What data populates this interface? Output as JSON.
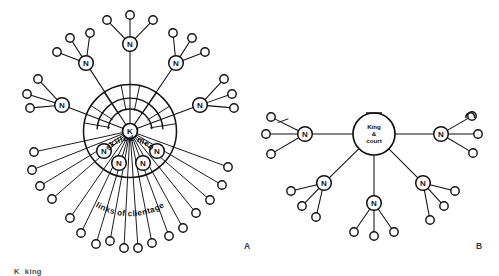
{
  "figure": {
    "background_color": "#ffffff",
    "ink_color": "#111111",
    "panels": [
      {
        "id": "A",
        "label": "A",
        "label_x": 247,
        "label_y": 249
      },
      {
        "id": "B",
        "label": "B",
        "label_x": 479,
        "label_y": 249
      }
    ],
    "legend": {
      "key": "K",
      "term": "king"
    }
  },
  "chart_data": {
    "type": "diagram",
    "panel_a": {
      "label": "A",
      "description": "Radial king-centred network with inner band of skilled men and outer links of clientage",
      "center": {
        "x": 130,
        "y": 131,
        "r": 7.5,
        "label": "K"
      },
      "boundaries": [
        {
          "name": "outer-circle",
          "cx": 130,
          "cy": 131,
          "r": 46.5
        },
        {
          "name": "inner-arc-outer",
          "cx": 130,
          "cy": 131,
          "r": 33.0,
          "start_deg": 183,
          "end_deg": 357
        },
        {
          "name": "inner-arc-inner",
          "cx": 130,
          "cy": 131,
          "r": 22.0,
          "start_deg": 185,
          "end_deg": 355
        }
      ],
      "arc_label": {
        "text": "skilled men",
        "cx": 130,
        "cy": 131,
        "r": 27.5
      },
      "lower_label": {
        "text": "links of clientage",
        "cx": 130,
        "cy": 131,
        "r": 67
      },
      "skilled_spokes_deg": [
        190,
        213,
        236,
        259,
        282,
        305,
        328,
        351
      ],
      "nobles_outer": [
        {
          "label": "N",
          "x": 130,
          "y": 44,
          "leaves": [
            {
              "x": 107,
              "y": 20
            },
            {
              "x": 130,
              "y": 15
            },
            {
              "x": 153,
              "y": 20
            }
          ]
        },
        {
          "label": "N",
          "x": 86,
          "y": 63,
          "leaves": [
            {
              "x": 57,
              "y": 52
            },
            {
              "x": 70,
              "y": 38
            },
            {
              "x": 90,
              "y": 33
            }
          ]
        },
        {
          "label": "N",
          "x": 176,
          "y": 63,
          "leaves": [
            {
              "x": 173,
              "y": 33
            },
            {
              "x": 192,
              "y": 38
            },
            {
              "x": 205,
              "y": 52
            }
          ]
        },
        {
          "label": "N",
          "x": 62,
          "y": 105,
          "leaves": [
            {
              "x": 27,
              "y": 94
            },
            {
              "x": 30,
              "y": 108
            },
            {
              "x": 38,
              "y": 79
            }
          ]
        },
        {
          "label": "N",
          "x": 200,
          "y": 105,
          "leaves": [
            {
              "x": 224,
              "y": 79
            },
            {
              "x": 232,
              "y": 94
            },
            {
              "x": 234,
              "y": 108
            }
          ]
        }
      ],
      "nobles_inner": [
        {
          "label": "N",
          "x": 104,
          "y": 151,
          "leaves": [
            {
              "x": 32,
              "y": 170
            },
            {
              "x": 40,
              "y": 186
            },
            {
              "x": 52,
              "y": 199
            }
          ]
        },
        {
          "label": "N",
          "x": 119,
          "y": 163,
          "leaves": [
            {
              "x": 70,
              "y": 218
            },
            {
              "x": 81,
              "y": 233
            },
            {
              "x": 96,
              "y": 244
            }
          ]
        },
        {
          "label": "N",
          "x": 143,
          "y": 163,
          "leaves": [
            {
              "x": 152,
              "y": 243
            },
            {
              "x": 169,
              "y": 236
            },
            {
              "x": 183,
              "y": 228
            }
          ]
        },
        {
          "label": "N",
          "x": 157,
          "y": 151,
          "leaves": [
            {
              "x": 196,
              "y": 213
            },
            {
              "x": 210,
              "y": 200
            },
            {
              "x": 222,
              "y": 185
            }
          ]
        }
      ],
      "extra_clientage_leaves": [
        {
          "x": 124,
          "y": 248
        },
        {
          "x": 138,
          "y": 248
        },
        {
          "x": 110,
          "y": 241
        },
        {
          "x": 228,
          "y": 167
        },
        {
          "x": 34,
          "y": 152
        }
      ]
    },
    "panel_b": {
      "label": "B",
      "description": "Flat king-and-court hub with five noble nodes each holding their own clients",
      "center": {
        "x": 374,
        "y": 134,
        "r": 21,
        "lines": [
          "King",
          "&",
          "court"
        ]
      },
      "nobles": [
        {
          "label": "N",
          "x": 305,
          "y": 134,
          "leaves": [
            {
              "x": 271,
              "y": 117
            },
            {
              "x": 266,
              "y": 134
            },
            {
              "x": 271,
              "y": 154
            }
          ]
        },
        {
          "label": "N",
          "x": 441,
          "y": 134,
          "leaves": [
            {
              "x": 472,
              "y": 116
            },
            {
              "x": 478,
              "y": 134
            },
            {
              "x": 473,
              "y": 153
            }
          ]
        },
        {
          "label": "N",
          "x": 324,
          "y": 183,
          "leaves": [
            {
              "x": 291,
              "y": 191
            },
            {
              "x": 302,
              "y": 206
            },
            {
              "x": 316,
              "y": 217
            }
          ]
        },
        {
          "label": "N",
          "x": 374,
          "y": 203,
          "leaves": [
            {
              "x": 354,
              "y": 232
            },
            {
              "x": 374,
              "y": 236
            },
            {
              "x": 394,
              "y": 232
            }
          ]
        },
        {
          "label": "N",
          "x": 423,
          "y": 183,
          "leaves": [
            {
              "x": 455,
              "y": 191
            },
            {
              "x": 444,
              "y": 206
            },
            {
              "x": 430,
              "y": 220
            }
          ]
        }
      ],
      "hook_marks": [
        {
          "name": "hook-top-right",
          "x": 470,
          "y": 112
        },
        {
          "name": "tick-hub-top",
          "x": 374,
          "y": 113
        },
        {
          "name": "tick-left-node",
          "x": 283,
          "y": 120
        }
      ]
    }
  }
}
